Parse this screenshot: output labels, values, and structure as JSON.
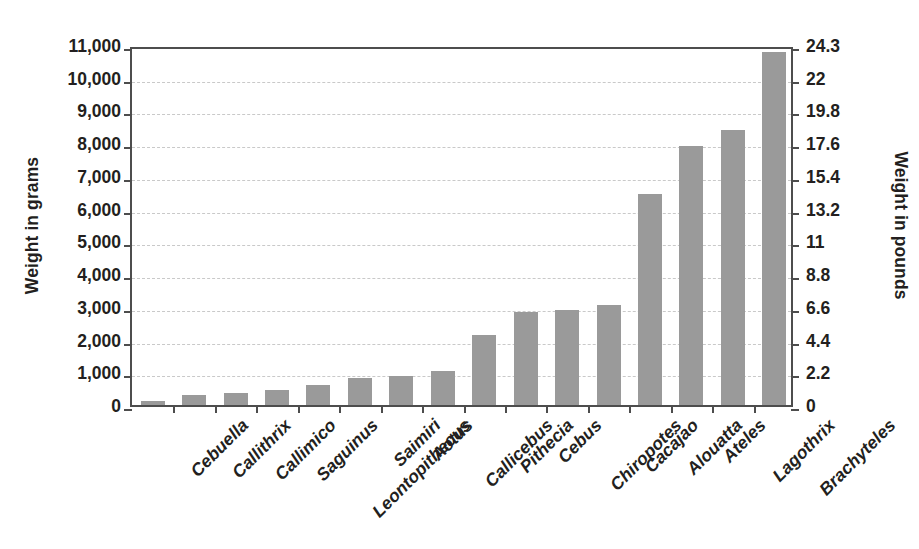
{
  "chart_data": {
    "type": "bar",
    "title": "",
    "xlabel": "",
    "ylabel": "Weight in grams",
    "ylabel_right": "Weight in pounds",
    "categories": [
      "Cebuella",
      "Callithrix",
      "Callimico",
      "Saguinus",
      "Leontopithecus",
      "Saimiri",
      "Aotus",
      "Callicebus",
      "Pithecia",
      "Cebus",
      "Chiropotes",
      "Cacajao",
      "Alouatta",
      "Ateles",
      "Lagothrix",
      "Brachyteles"
    ],
    "values": [
      120,
      320,
      380,
      450,
      600,
      830,
      900,
      1030,
      2150,
      2850,
      2900,
      3050,
      6450,
      7900,
      8400,
      10800
    ],
    "units": "grams",
    "ylim": [
      0,
      11000
    ],
    "yticks": [
      0,
      1000,
      2000,
      3000,
      4000,
      5000,
      6000,
      7000,
      8000,
      9000,
      10000,
      11000
    ],
    "ytick_labels": [
      "0",
      "1,000",
      "2,000",
      "3,000",
      "4,000",
      "5,000",
      "6,000",
      "7,000",
      "8,000",
      "9,000",
      "10,000",
      "11,000"
    ],
    "ylim_right": [
      0,
      24.3
    ],
    "ytick_labels_right": [
      "0",
      "2.2",
      "4.4",
      "6.6",
      "8.8",
      "11",
      "13.2",
      "15.4",
      "17.6",
      "19.8",
      "22",
      "24.3"
    ],
    "grid": true,
    "legend": null,
    "bar_color": "#9a9a9a",
    "axis_color": "#4d4d4d",
    "grid_color": "#c9c9c9",
    "background": "#ffffff"
  }
}
